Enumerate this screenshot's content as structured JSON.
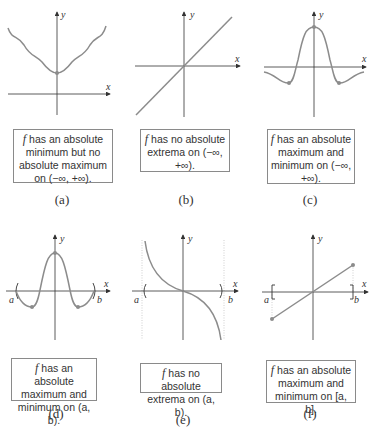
{
  "colors": {
    "axis": "#333333",
    "curve": "#8c8c8c",
    "point": "#8c8c8c",
    "dashed": "#b0b0b0",
    "box_border": "#8a8a8a"
  },
  "axis_labels": {
    "x": "x",
    "y": "y",
    "a": "a",
    "b": "b"
  },
  "panels": [
    {
      "id": "a",
      "label": "(a)",
      "caption": {
        "f": "f",
        "text": " has an absolute minimum but no absolute maximum on (−∞, +∞)."
      },
      "description": "curve with a single lowest point marked on y-axis, rising to infinity both sides"
    },
    {
      "id": "b",
      "label": "(b)",
      "caption": {
        "f": "f",
        "text": " has no absolute extrema on (−∞, +∞)."
      },
      "description": "straight line through origin"
    },
    {
      "id": "c",
      "label": "(c)",
      "caption": {
        "f": "f",
        "text": " has an absolute maximum and minimum on (−∞, +∞)."
      },
      "description": "bell curve with max on y-axis and two marked minima"
    },
    {
      "id": "d",
      "label": "(d)",
      "caption": {
        "f": "f",
        "text": " has an absolute maximum and minimum on (a, b)."
      },
      "description": "bell curve on open interval (a, b) with max and two marked minima"
    },
    {
      "id": "e",
      "label": "(e)",
      "caption": {
        "f": "f",
        "text": " has no absolute extrema on (a, b)."
      },
      "description": "decreasing curve with vertical asymptotes at a and b"
    },
    {
      "id": "f",
      "label": "(f)",
      "caption": {
        "f": "f",
        "text": " has an absolute maximum and minimum on [a, b]."
      },
      "description": "line segment on closed interval [a, b] with endpoints marked"
    }
  ]
}
